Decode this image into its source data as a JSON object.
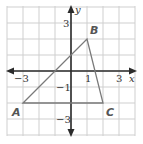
{
  "figure": {
    "type": "coordinate-plane-triangle",
    "colors": {
      "background": "#ffffff",
      "grid": "#cfcfcf",
      "axes": "#2b2b2b",
      "triangle": "#7a7a7a",
      "labels": "#333333",
      "vertex_labels": "#555555"
    },
    "grid": {
      "x_min": -4,
      "x_max": 4,
      "y_min": -4,
      "y_max": 4,
      "step": 1
    },
    "axes": {
      "x_label": "x",
      "y_label": "y"
    },
    "tick_labels": {
      "x": [
        {
          "value": -3,
          "text": "−3"
        },
        {
          "value": 1,
          "text": "1"
        },
        {
          "value": 3,
          "text": "3"
        }
      ],
      "y": [
        {
          "value": 3,
          "text": "3"
        },
        {
          "value": -1,
          "text": "−1"
        },
        {
          "value": -3,
          "text": "−3"
        }
      ]
    },
    "vertices": [
      {
        "name": "A",
        "x": -3,
        "y": -2
      },
      {
        "name": "B",
        "x": 1,
        "y": 2
      },
      {
        "name": "C",
        "x": 2,
        "y": -2
      }
    ]
  }
}
